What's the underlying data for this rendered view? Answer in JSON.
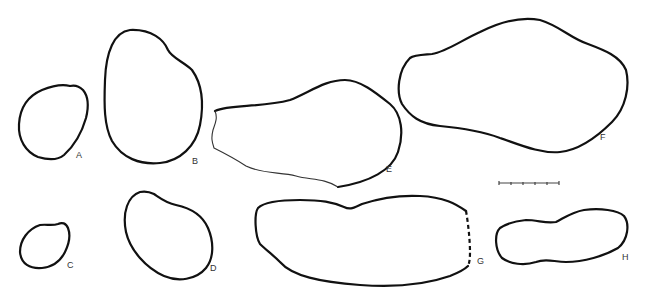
{
  "figure": {
    "labels": {
      "A": "A",
      "B": "B",
      "C": "C",
      "D": "D",
      "E": "E",
      "F": "F",
      "G": "G",
      "H": "H"
    },
    "scale_bar": {
      "segments": 5,
      "ticks": 6
    },
    "colors": {
      "line": "#111111",
      "background": "#ffffff"
    }
  }
}
